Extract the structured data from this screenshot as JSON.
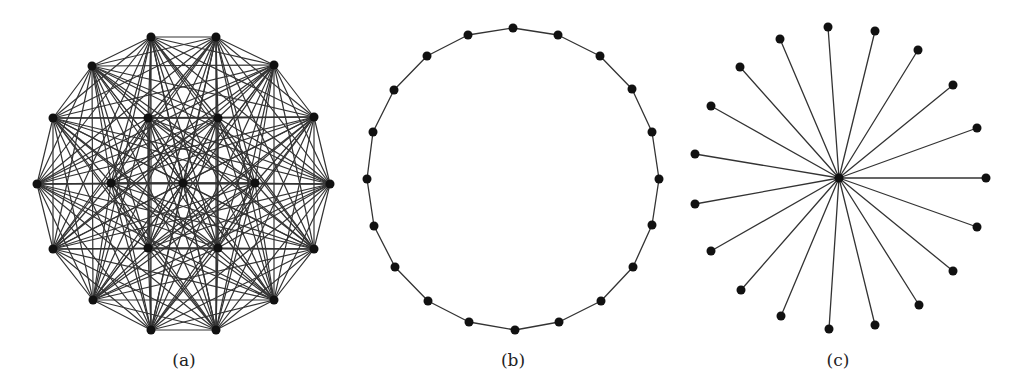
{
  "figure": {
    "panels": [
      {
        "id": "a",
        "label": "(a)",
        "graph_type": "complete",
        "label_x": 184,
        "node_count": 19,
        "nodes": [
          [
            151,
            37
          ],
          [
            216,
            37
          ],
          [
            274,
            65
          ],
          [
            314,
            117
          ],
          [
            330,
            184
          ],
          [
            314,
            249
          ],
          [
            274,
            300
          ],
          [
            216,
            330
          ],
          [
            151,
            330
          ],
          [
            93,
            300
          ],
          [
            53,
            249
          ],
          [
            37,
            184
          ],
          [
            53,
            118
          ],
          [
            92,
            66
          ],
          [
            148,
            118
          ],
          [
            218,
            118
          ],
          [
            111,
            183
          ],
          [
            183,
            183
          ],
          [
            255,
            183
          ],
          [
            148,
            248
          ],
          [
            218,
            248
          ]
        ]
      },
      {
        "id": "b",
        "label": "(b)",
        "graph_type": "cycle",
        "label_x": 513,
        "node_count": 20,
        "nodes": [
          [
            513,
            28
          ],
          [
            558,
            35
          ],
          [
            600,
            56
          ],
          [
            632,
            89
          ],
          [
            652,
            132
          ],
          [
            659,
            179
          ],
          [
            652,
            225
          ],
          [
            633,
            267
          ],
          [
            601,
            301
          ],
          [
            559,
            322
          ],
          [
            515,
            330
          ],
          [
            469,
            322
          ],
          [
            428,
            301
          ],
          [
            395,
            267
          ],
          [
            374,
            226
          ],
          [
            367,
            179
          ],
          [
            373,
            132
          ],
          [
            394,
            90
          ],
          [
            427,
            56
          ],
          [
            468,
            35
          ]
        ]
      },
      {
        "id": "c",
        "label": "(c)",
        "graph_type": "star",
        "label_x": 838,
        "node_count": 20,
        "center": [
          839,
          178
        ],
        "nodes": [
          [
            828,
            27
          ],
          [
            875,
            31
          ],
          [
            918,
            50
          ],
          [
            953,
            85
          ],
          [
            977,
            128
          ],
          [
            986,
            178
          ],
          [
            977,
            227
          ],
          [
            953,
            271
          ],
          [
            919,
            305
          ],
          [
            875,
            325
          ],
          [
            829,
            329
          ],
          [
            781,
            316
          ],
          [
            741,
            290
          ],
          [
            711,
            251
          ],
          [
            695,
            204
          ],
          [
            695,
            154
          ],
          [
            711,
            106
          ],
          [
            740,
            67
          ],
          [
            780,
            39
          ]
        ]
      }
    ],
    "style": {
      "edge_color": "#333333",
      "node_color": "#111111",
      "node_radius": 4.5,
      "edge_width_dense": 1.2,
      "edge_width": 1.3
    }
  }
}
